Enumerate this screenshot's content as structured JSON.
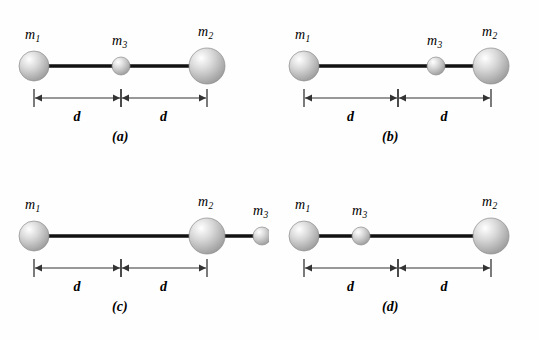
{
  "figure": {
    "background_color": "#fefefe",
    "rod_color": "#111111",
    "dimension_line_color": "#333333",
    "sphere_fill_light": "#ffffff",
    "sphere_fill_mid": "#d8d8d8",
    "sphere_fill_dark": "#9a9a9a",
    "sphere_edge": "#8c8c8c"
  },
  "labels": {
    "m1": "m",
    "m1_sub": "1",
    "m2": "m",
    "m2_sub": "2",
    "m3": "m",
    "m3_sub": "3",
    "distance": "d"
  },
  "panels": [
    {
      "id": "a",
      "letter": "(a)",
      "masses": [
        {
          "name": "m1",
          "label": "m",
          "sub": "1",
          "cx": 34,
          "cy": 66,
          "r": 15
        },
        {
          "name": "m3",
          "label": "m",
          "sub": "3",
          "cx": 121,
          "cy": 66,
          "r": 9
        },
        {
          "name": "m2",
          "label": "m",
          "sub": "2",
          "cx": 207,
          "cy": 66,
          "r": 18
        }
      ],
      "rod": {
        "x1": 34,
        "x2": 207,
        "y": 66
      },
      "dimensions": [
        {
          "label": "d",
          "x1": 34,
          "x2": 121,
          "y": 98
        },
        {
          "label": "d",
          "x1": 121,
          "x2": 207,
          "y": 98
        }
      ]
    },
    {
      "id": "b",
      "letter": "(b)",
      "masses": [
        {
          "name": "m1",
          "label": "m",
          "sub": "1",
          "cx": 34,
          "cy": 66,
          "r": 15
        },
        {
          "name": "m3",
          "label": "m",
          "sub": "3",
          "cx": 166,
          "cy": 66,
          "r": 9
        },
        {
          "name": "m2",
          "label": "m",
          "sub": "2",
          "cx": 221,
          "cy": 66,
          "r": 18
        }
      ],
      "rod": {
        "x1": 34,
        "x2": 221,
        "y": 66
      },
      "dimensions": [
        {
          "label": "d",
          "x1": 34,
          "x2": 128,
          "y": 98
        },
        {
          "label": "d",
          "x1": 128,
          "x2": 221,
          "y": 98
        }
      ]
    },
    {
      "id": "c",
      "letter": "(c)",
      "masses": [
        {
          "name": "m1",
          "label": "m",
          "sub": "1",
          "cx": 34,
          "cy": 66,
          "r": 15
        },
        {
          "name": "m2",
          "label": "m",
          "sub": "2",
          "cx": 207,
          "cy": 66,
          "r": 18
        },
        {
          "name": "m3",
          "label": "m",
          "sub": "3",
          "cx": 262,
          "cy": 66,
          "r": 9
        }
      ],
      "rod": {
        "x1": 34,
        "x2": 262,
        "y": 66
      },
      "dimensions": [
        {
          "label": "d",
          "x1": 34,
          "x2": 121,
          "y": 98
        },
        {
          "label": "d",
          "x1": 121,
          "x2": 207,
          "y": 98
        }
      ]
    },
    {
      "id": "d",
      "letter": "(d)",
      "masses": [
        {
          "name": "m1",
          "label": "m",
          "sub": "1",
          "cx": 34,
          "cy": 66,
          "r": 15
        },
        {
          "name": "m3",
          "label": "m",
          "sub": "3",
          "cx": 91,
          "cy": 66,
          "r": 9
        },
        {
          "name": "m2",
          "label": "m",
          "sub": "2",
          "cx": 221,
          "cy": 66,
          "r": 18
        }
      ],
      "rod": {
        "x1": 34,
        "x2": 221,
        "y": 66
      },
      "dimensions": [
        {
          "label": "d",
          "x1": 34,
          "x2": 128,
          "y": 98
        },
        {
          "label": "d",
          "x1": 128,
          "x2": 221,
          "y": 98
        }
      ]
    }
  ]
}
